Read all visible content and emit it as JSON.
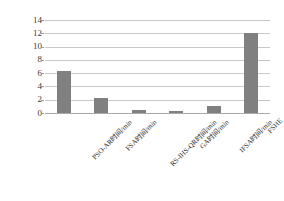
{
  "chart_data": {
    "type": "bar",
    "title": "",
    "xlabel": "",
    "ylabel": "",
    "categories": [
      "PSO-AR时间/min",
      "FSA时间/min",
      "RS-IHS-QR时间/min",
      "GA时间/min",
      "IFSA时间/min",
      "FSHE"
    ],
    "values": [
      6.4,
      2.2,
      0.4,
      0.3,
      1.1,
      12.0
    ],
    "ylim": [
      0,
      14
    ],
    "yticks": [
      0,
      2,
      4,
      6,
      8,
      10,
      12,
      14
    ],
    "ytick_labels": [
      "0",
      "2",
      "4",
      "6",
      "8",
      "10",
      "12",
      "14"
    ],
    "grid": true,
    "legend": false,
    "series_color": "#808080",
    "gridline_color": "#c9c9c9",
    "axis_text_color": "#2e2e2e"
  }
}
